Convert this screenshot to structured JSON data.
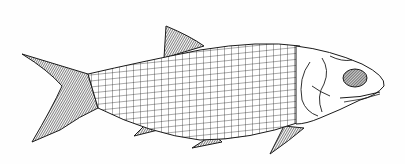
{
  "illustration": {
    "subject": "fish",
    "style": "black-and-white scientific line drawing",
    "alt": "Line drawing of a fish with rectangular scale pattern, facing right",
    "colors": {
      "background": "#fefefe",
      "ink": "#1a1a1a",
      "shade": "#3a3a3a"
    }
  }
}
